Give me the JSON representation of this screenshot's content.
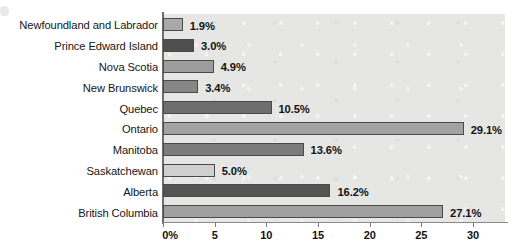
{
  "chart_data": {
    "type": "bar",
    "orientation": "horizontal",
    "title": "",
    "xlabel": "",
    "ylabel": "",
    "xlim": [
      0,
      33.1
    ],
    "grid": false,
    "legend": false,
    "categories": [
      "Newfoundland and Labrador",
      "Prince Edward Island",
      "Nova Scotia",
      "New Brunswick",
      "Quebec",
      "Ontario",
      "Manitoba",
      "Saskatchewan",
      "Alberta",
      "British Columbia"
    ],
    "values": [
      1.9,
      3.0,
      4.9,
      3.4,
      10.5,
      29.1,
      13.6,
      5.0,
      16.2,
      27.1
    ],
    "data_labels": [
      "1.9%",
      "3.0%",
      "4.9%",
      "3.4%",
      "10.5%",
      "29.1%",
      "13.6%",
      "5.0%",
      "16.2%",
      "27.1%"
    ],
    "bar_colors": [
      "#a9a9a9",
      "#4f4f4f",
      "#9d9d9d",
      "#868686",
      "#6e6e6e",
      "#a3a3a3",
      "#7c7c7c",
      "#cfcfcf",
      "#545454",
      "#a0a0a0"
    ],
    "tick_labels": [
      "0%",
      "5",
      "10",
      "15",
      "20",
      "25",
      "30"
    ],
    "tick_values": [
      0,
      5,
      10,
      15,
      20,
      25,
      30
    ],
    "plot_background": "#e6e6e4",
    "axis_color": "#6d6d6d",
    "bar_border_color": "#4a4a4a"
  }
}
